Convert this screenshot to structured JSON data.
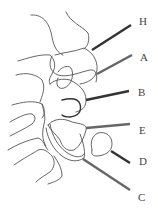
{
  "diagram": {
    "pointers": [
      {
        "id": "H",
        "label": "H",
        "color": "#333333",
        "x1": 92,
        "y1": 50,
        "x2": 131,
        "y2": 25,
        "label_x": 139,
        "label_y": 22
      },
      {
        "id": "A",
        "label": "A",
        "color": "#666666",
        "x1": 97,
        "y1": 74,
        "x2": 132,
        "y2": 55,
        "label_x": 140,
        "label_y": 58
      },
      {
        "id": "B",
        "label": "B",
        "color": "#333333",
        "x1": 86,
        "y1": 100,
        "x2": 129,
        "y2": 91,
        "label_x": 138,
        "label_y": 93
      },
      {
        "id": "E",
        "label": "E",
        "color": "#666666",
        "x1": 86,
        "y1": 128,
        "x2": 130,
        "y2": 124,
        "label_x": 139,
        "label_y": 131
      },
      {
        "id": "D",
        "label": "D",
        "color": "#333333",
        "x1": 111,
        "y1": 151,
        "x2": 130,
        "y2": 163,
        "label_x": 139,
        "label_y": 162
      },
      {
        "id": "C",
        "label": "C",
        "color": "#666666",
        "x1": 83,
        "y1": 159,
        "x2": 130,
        "y2": 190,
        "label_x": 138,
        "label_y": 198
      }
    ]
  }
}
